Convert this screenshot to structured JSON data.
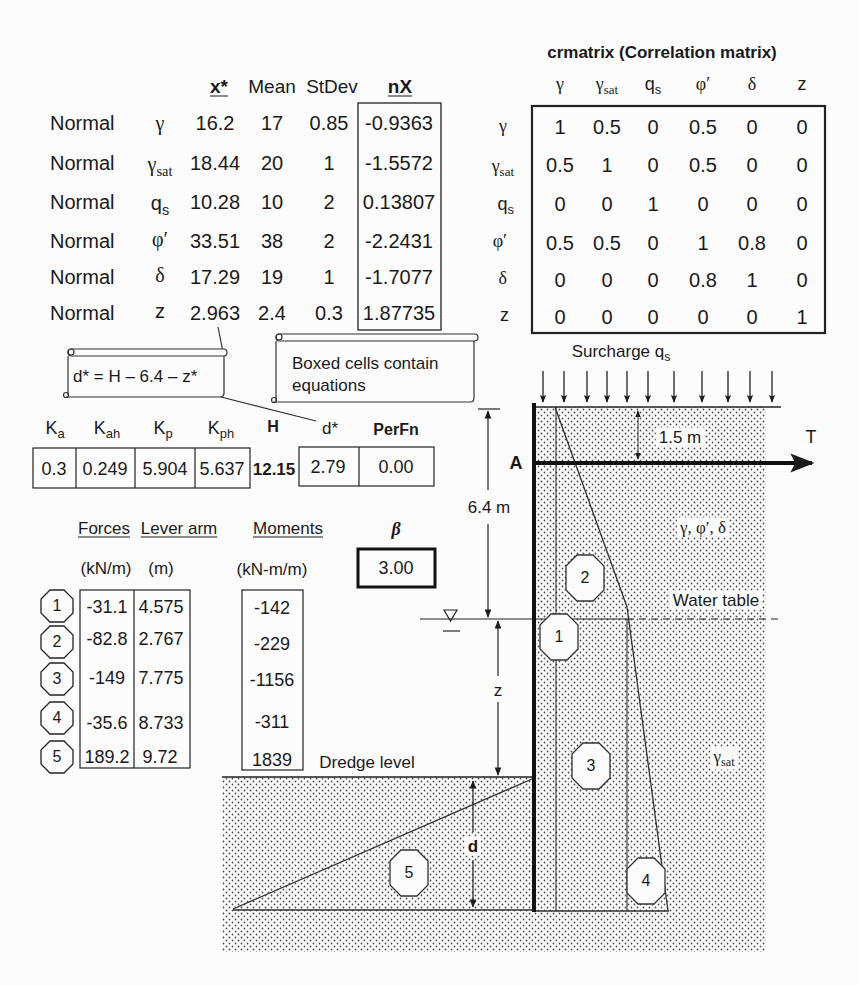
{
  "variables": {
    "headers": {
      "x_star": "x*",
      "mean": "Mean",
      "stdev": "StDev",
      "nx": "nX"
    },
    "rows": [
      {
        "dist": "Normal",
        "sym": "γ",
        "sub": "",
        "x_star": "16.2",
        "mean": "17",
        "stdev": "0.85",
        "nx": "-0.9363"
      },
      {
        "dist": "Normal",
        "sym": "γ",
        "sub": "sat",
        "x_star": "18.44",
        "mean": "20",
        "stdev": "1",
        "nx": "-1.5572"
      },
      {
        "dist": "Normal",
        "sym": "q",
        "sub": "s",
        "x_star": "10.28",
        "mean": "10",
        "stdev": "2",
        "nx": "0.13807"
      },
      {
        "dist": "Normal",
        "sym": "φ′",
        "sub": "",
        "x_star": "33.51",
        "mean": "38",
        "stdev": "2",
        "nx": "-2.2431"
      },
      {
        "dist": "Normal",
        "sym": "δ",
        "sub": "",
        "x_star": "17.29",
        "mean": "19",
        "stdev": "1",
        "nx": "-1.7077"
      },
      {
        "dist": "Normal",
        "sym": "z",
        "sub": "",
        "x_star": "2.963",
        "mean": "2.4",
        "stdev": "0.3",
        "nx": "1.87735"
      }
    ]
  },
  "correlation_matrix": {
    "title": "crmatrix (Correlation matrix)",
    "labels": [
      {
        "sym": "γ",
        "sub": ""
      },
      {
        "sym": "γ",
        "sub": "sat"
      },
      {
        "sym": "q",
        "sub": "s"
      },
      {
        "sym": "φ′",
        "sub": ""
      },
      {
        "sym": "δ",
        "sub": ""
      },
      {
        "sym": "z",
        "sub": ""
      }
    ],
    "values": [
      [
        "1",
        "0.5",
        "0",
        "0.5",
        "0",
        "0"
      ],
      [
        "0.5",
        "1",
        "0",
        "0.5",
        "0",
        "0"
      ],
      [
        "0",
        "0",
        "1",
        "0",
        "0",
        "0"
      ],
      [
        "0.5",
        "0.5",
        "0",
        "1",
        "0.8",
        "0"
      ],
      [
        "0",
        "0",
        "0",
        "0.8",
        "1",
        "0"
      ],
      [
        "0",
        "0",
        "0",
        "0",
        "0",
        "1"
      ]
    ]
  },
  "notes": {
    "d_star_equation": "d* = H – 6.4 – z*",
    "boxed_cells": [
      "Boxed cells contain",
      "equations"
    ]
  },
  "earth_pressure": {
    "headers": [
      {
        "sym": "K",
        "sub": "a"
      },
      {
        "sym": "K",
        "sub": "ah"
      },
      {
        "sym": "K",
        "sub": "p"
      },
      {
        "sym": "K",
        "sub": "ph"
      }
    ],
    "values": [
      "0.3",
      "0.249",
      "5.904",
      "5.637"
    ],
    "H_label": "H",
    "H_value": "12.15",
    "d_star_label": "d*",
    "d_star_value": "2.79",
    "perfn_label": "PerFn",
    "perfn_value": "0.00"
  },
  "forces_table": {
    "headers": {
      "forces": "Forces",
      "lever_arm": "Lever arm",
      "moments": "Moments",
      "beta": "β"
    },
    "units": {
      "forces": "(kN/m)",
      "lever_arm": "(m)",
      "moments": "(kN-m/m)"
    },
    "beta_value": "3.00",
    "rows": [
      {
        "id": "1",
        "force": "-31.1",
        "lever": "4.575",
        "moment": "-142"
      },
      {
        "id": "2",
        "force": "-82.8",
        "lever": "2.767",
        "moment": "-229"
      },
      {
        "id": "3",
        "force": "-149",
        "lever": "7.775",
        "moment": "-1156"
      },
      {
        "id": "4",
        "force": "-35.6",
        "lever": "8.733",
        "moment": "-311"
      },
      {
        "id": "5",
        "force": "189.2",
        "lever": "9.72",
        "moment": "1839"
      }
    ]
  },
  "diagram": {
    "surcharge_label": {
      "text": "Surcharge q",
      "sub": "s"
    },
    "anchor_label": "A",
    "tie_label": "T",
    "anchor_depth": "1.5 m",
    "water_depth": "6.4 m",
    "z_label": "z",
    "d_label": "d",
    "upper_soil": "γ, φ′, δ",
    "water_table": "Water table",
    "lower_soil": {
      "sym": "γ",
      "sub": "sat"
    },
    "dredge_level": "Dredge level",
    "zones": [
      "1",
      "2",
      "3",
      "4",
      "5"
    ]
  }
}
